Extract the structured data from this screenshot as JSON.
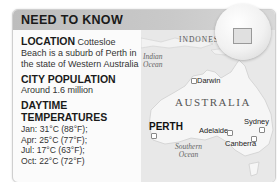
{
  "header": {
    "title": "NEED TO KNOW"
  },
  "facts": {
    "location": {
      "heading": "LOCATION",
      "text_inline": "Cottesloe Beach",
      "text_rest": "is a suburb of Perth in the state of Western Australia"
    },
    "population": {
      "heading": "CITY POPULATION",
      "text": "Around 1.6 million"
    },
    "temperatures": {
      "heading_line1": "DAYTIME",
      "heading_line2": "TEMPERATURES",
      "items": [
        "Jan: 31°C (88°F);",
        "Apr: 25°C (77°F);",
        "Jul: 17°C (63°F);",
        "Oct: 22°C (72°F)"
      ]
    }
  },
  "map": {
    "labels": {
      "indonesia": "INDONESIA",
      "indian_ocean_1": "Indian",
      "indian_ocean_2": "Ocean",
      "australia": "AUSTRALIA",
      "southern_ocean_1": "Southern",
      "southern_ocean_2": "Ocean"
    },
    "cities": {
      "darwin": "Darwin",
      "perth": "PERTH",
      "adelaide": "Adelaide",
      "sydney": "Sydney",
      "canberra": "Canberra"
    }
  },
  "colors": {
    "header_bg": "#c4c4c4",
    "land": "#f4f4f4",
    "sea": "#e6e6e6"
  }
}
